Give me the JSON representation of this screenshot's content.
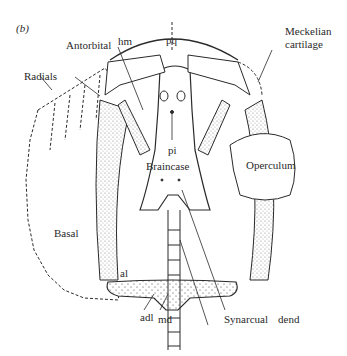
{
  "figure": {
    "panel_label": "(b)",
    "labels": {
      "antorbital": "Antorbital",
      "hm": "hm",
      "pq": "pq",
      "meckelian": "Meckelian cartilage",
      "meckelian_line1": "Meckelian",
      "meckelian_line2": "cartilage",
      "radials": "Radials",
      "pi": "pi",
      "braincase": "Braincase",
      "operculum": "Operculum",
      "basal": "Basal",
      "al": "al",
      "adl": "adl",
      "md": "md",
      "synarcual": "Synarcual",
      "dend": "dend"
    },
    "colors": {
      "ink": "#2a2a2a",
      "stipple": "#bdbdbd",
      "background": "#ffffff"
    }
  }
}
